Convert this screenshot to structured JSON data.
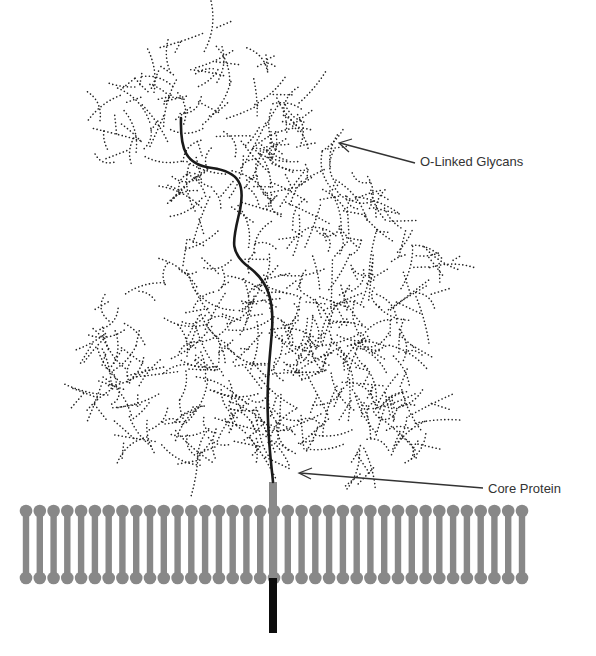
{
  "diagram": {
    "type": "proteoglycan-membrane-schematic",
    "labels": {
      "glycans": "O-Linked Glycans",
      "core_protein": "Core Protein"
    },
    "colors": {
      "membrane": "#888888",
      "glycan_dots": "#222222",
      "core_protein": "#1a1a1a",
      "anchor_stem": "#8a8a8a",
      "anchor_tail": "#0d0d0d",
      "arrow": "#333333",
      "label_text": "#333333"
    },
    "membrane": {
      "x_start": 26,
      "x_end": 522,
      "lipid_count": 37,
      "top_head_y": 511,
      "bottom_head_y": 578
    },
    "components": [
      {
        "name": "O-Linked Glycans",
        "style": "dotted branching chains"
      },
      {
        "name": "Core Protein",
        "style": "solid black curve"
      },
      {
        "name": "Lipid Bilayer",
        "style": "gray phospholipid rows"
      }
    ]
  }
}
